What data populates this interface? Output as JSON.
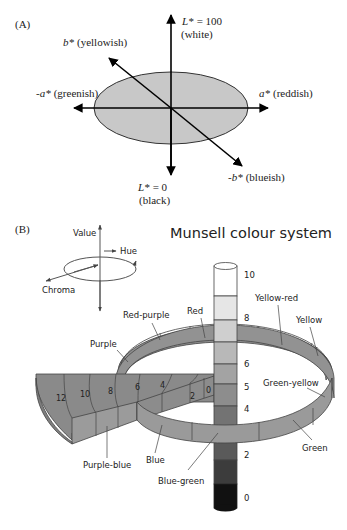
{
  "panel_a": {
    "label": "(A)",
    "axes": {
      "l_top": {
        "name": "L*",
        "value": "= 100",
        "desc": "(white)"
      },
      "l_bottom": {
        "name": "L*",
        "value": "= 0",
        "desc": "(black)"
      },
      "a_pos": {
        "name": "a*",
        "desc": "(reddish)"
      },
      "a_neg": {
        "name": "-a*",
        "desc": "(greenish)"
      },
      "b_pos": {
        "name": "b*",
        "desc": "(yellowish)"
      },
      "b_neg": {
        "name": "-b*",
        "desc": "(blueish)"
      }
    },
    "ellipse_color": "#c8c8c8"
  },
  "panel_b": {
    "label": "(B)",
    "title": "Munsell colour system",
    "legend": {
      "value": "Value",
      "hue": "Hue",
      "chroma": "Chroma"
    },
    "value_scale": [
      "10",
      "8",
      "6",
      "5",
      "4",
      "2",
      "0"
    ],
    "chroma_scale": [
      "12",
      "10",
      "8",
      "6",
      "4",
      "2",
      "0"
    ],
    "hues": {
      "red_purple": "Red-purple",
      "red": "Red",
      "yellow_red": "Yellow-red",
      "yellow": "Yellow",
      "purple": "Purple",
      "green_yellow": "Green-yellow",
      "green": "Green",
      "purple_blue": "Purple-blue",
      "blue": "Blue",
      "blue_green": "Blue-green"
    },
    "colors": {
      "ring_top": "#8e8e8e",
      "ring_side": "#9a9a9a",
      "wedge_top": "#8a8a8a",
      "wedge_side": "#999999",
      "column_steps": [
        "#ffffff",
        "#e6e6e6",
        "#cfcfcf",
        "#b8b8b8",
        "#a3a3a3",
        "#8d8d8d",
        "#737373",
        "#5a5a5a",
        "#3c3c3c",
        "#111111"
      ]
    }
  }
}
